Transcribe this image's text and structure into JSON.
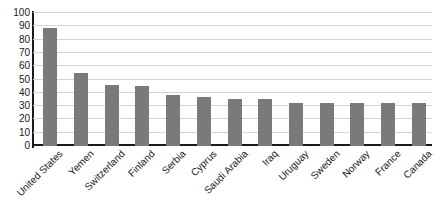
{
  "chart_data": {
    "type": "bar",
    "title": "",
    "subtitle": "",
    "xlabel": "",
    "ylabel": "",
    "ylim": [
      0,
      100
    ],
    "yticks": [
      100,
      90,
      80,
      70,
      60,
      50,
      40,
      30,
      20,
      10,
      0
    ],
    "grid": true,
    "legend": null,
    "legend_position": "none",
    "bar_color": "#7a7a7a",
    "gridline_color": "#d4d4d4",
    "axis_color": "#1a1a1a",
    "categories": [
      "United States",
      "Yemen",
      "Switzerland",
      "Finland",
      "Serbia",
      "Cyprus",
      "Saudi Arabia",
      "Iraq",
      "Uruguay",
      "Sweden",
      "Norway",
      "France",
      "Canada"
    ],
    "values": [
      89,
      55,
      46,
      45.5,
      38,
      37,
      35.5,
      35,
      32.5,
      32.5,
      32,
      32,
      32
    ]
  }
}
